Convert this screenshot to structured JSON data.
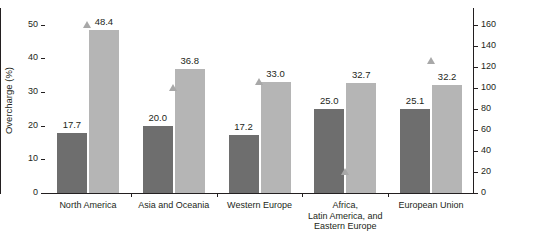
{
  "chart_data": {
    "type": "bar",
    "title": "",
    "subtitle": "",
    "categories": [
      "North America",
      "Asia and Oceania",
      "Western Europe",
      "Africa,\nLatin America, and\nEastern Europe",
      "European Union"
    ],
    "series": [
      {
        "name": "Median overcharge",
        "color": "#6e6e6e",
        "axis": "left",
        "values": [
          17.7,
          20.0,
          17.2,
          25.0,
          25.1
        ],
        "labels": [
          "17.7",
          "20.0",
          "17.2",
          "25.0",
          "25.1"
        ]
      },
      {
        "name": "Mean overcharge",
        "color": "#b5b5b5",
        "axis": "left",
        "values": [
          48.4,
          36.8,
          33.0,
          32.7,
          32.2
        ],
        "labels": [
          "48.4",
          "36.8",
          "33.0",
          "32.7",
          "32.2"
        ]
      },
      {
        "name": "Number of cartel episodes",
        "color": "#a8a8a8",
        "axis": "right",
        "marker": "triangle",
        "values": [
          160,
          100,
          106,
          20,
          126
        ]
      }
    ],
    "xlabel": "",
    "ylabel": "Overcharge (%)",
    "ylabel_right": "Number of cartel episodes",
    "ylim": [
      0,
      55
    ],
    "ylim_right": [
      0,
      176
    ],
    "yticks": [
      0,
      10,
      20,
      30,
      40,
      50
    ],
    "yticklabels": [
      "0",
      "10",
      "20",
      "30",
      "40",
      "50"
    ],
    "yticks_right": [
      0,
      20,
      40,
      60,
      80,
      100,
      120,
      140,
      160
    ],
    "yticklabels_right": [
      "0",
      "20",
      "40",
      "60",
      "80",
      "100",
      "120",
      "140",
      "160"
    ],
    "grid": false,
    "legend": "none"
  }
}
